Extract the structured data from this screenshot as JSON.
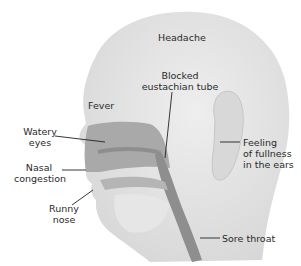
{
  "diagram": {
    "labels": {
      "headache": "Headache",
      "blocked_eustachian_tube": [
        "Blocked",
        "eustachian tube"
      ],
      "fever": "Fever",
      "watery_eyes": [
        "Watery",
        "eyes"
      ],
      "nasal_congestion": [
        "Nasal",
        "congestion"
      ],
      "runny_nose": [
        "Runny",
        "nose"
      ],
      "ear_fullness": [
        "Feeling",
        "of  fullness",
        "in the ears"
      ],
      "sore_throat": "Sore throat"
    },
    "colors": {
      "skin": "#e4e4e4",
      "skin_shadow": "#d2d2d2",
      "cavity": "#a9a9a9",
      "cavity_dark": "#8e8e8e",
      "text": "#2a2a2a",
      "leader": "#222222"
    }
  }
}
